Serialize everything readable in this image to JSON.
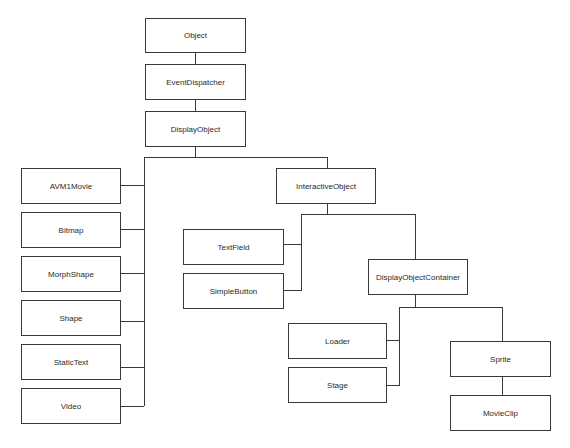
{
  "diagram": {
    "type": "class-hierarchy",
    "nodes": {
      "object": "Object",
      "event_dispatcher": "EventDispatcher",
      "display_object": "DisplayObject",
      "avm1movie": "AVM1Movie",
      "bitmap": "Bitmap",
      "morph_shape": "MorphShape",
      "shape": "Shape",
      "static_text": "StaticText",
      "video": "Video",
      "interactive_object": "InteractiveObject",
      "text_field": "TextField",
      "simple_button": "SimpleButton",
      "display_object_container": "DisplayObjectContainer",
      "loader": "Loader",
      "stage": "Stage",
      "sprite": "Sprite",
      "movie_clip": "MovieClip"
    },
    "edges": [
      [
        "Object",
        "EventDispatcher"
      ],
      [
        "EventDispatcher",
        "DisplayObject"
      ],
      [
        "DisplayObject",
        "AVM1Movie"
      ],
      [
        "DisplayObject",
        "Bitmap"
      ],
      [
        "DisplayObject",
        "MorphShape"
      ],
      [
        "DisplayObject",
        "Shape"
      ],
      [
        "DisplayObject",
        "StaticText"
      ],
      [
        "DisplayObject",
        "Video"
      ],
      [
        "DisplayObject",
        "InteractiveObject"
      ],
      [
        "InteractiveObject",
        "TextField"
      ],
      [
        "InteractiveObject",
        "SimpleButton"
      ],
      [
        "InteractiveObject",
        "DisplayObjectContainer"
      ],
      [
        "DisplayObjectContainer",
        "Loader"
      ],
      [
        "DisplayObjectContainer",
        "Stage"
      ],
      [
        "DisplayObjectContainer",
        "Sprite"
      ],
      [
        "Sprite",
        "MovieClip"
      ]
    ]
  }
}
